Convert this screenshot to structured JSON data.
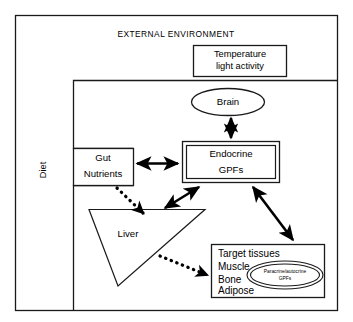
{
  "diagram": {
    "title": "EXTERNAL ENVIRONMENT",
    "external_environment_label": "EXTERNAL ENVIRONMENT",
    "diet_label": "Diet",
    "stimuli_box": {
      "line1": "Temperature",
      "line2": "light activity"
    },
    "brain": {
      "label": "Brain"
    },
    "gut": {
      "line1": "Gut",
      "line2": "Nutrients"
    },
    "endocrine": {
      "line1": "Endocrine",
      "line2": "GPFs"
    },
    "liver": {
      "label": "Liver"
    },
    "target_tissues": {
      "heading": "Target tissues",
      "items": [
        "Muscle",
        "Bone",
        "Adipose"
      ],
      "item_muscle": "Muscle",
      "item_bone": "Bone",
      "item_adipose": "Adipose"
    },
    "paracrine": {
      "line1": "Paracrine/autocrine",
      "line2": "GPFs"
    },
    "colors": {
      "stroke": "#1a1a1a",
      "arrow": "#000000",
      "background": "#ffffff"
    },
    "connections": [
      {
        "from": "Brain",
        "to": "Endocrine GPFs",
        "style": "solid",
        "heads": "double"
      },
      {
        "from": "Gut Nutrients",
        "to": "Endocrine GPFs",
        "style": "solid",
        "heads": "double"
      },
      {
        "from": "Endocrine GPFs",
        "to": "Liver",
        "style": "solid",
        "heads": "double"
      },
      {
        "from": "Endocrine GPFs",
        "to": "Target tissues",
        "style": "solid",
        "heads": "double"
      },
      {
        "from": "Gut Nutrients",
        "to": "Liver",
        "style": "dotted",
        "heads": "single"
      },
      {
        "from": "Liver",
        "to": "Target tissues",
        "style": "dotted",
        "heads": "single"
      }
    ]
  }
}
